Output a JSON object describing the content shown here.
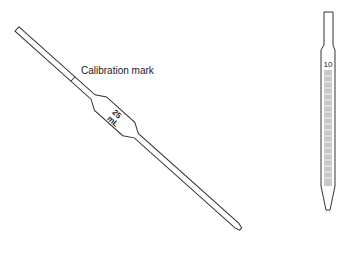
{
  "diagram": {
    "volumetric_pipette": {
      "annotation": "Calibration mark",
      "volume_number": "25",
      "volume_unit": "mL"
    },
    "graduated_pipette": {
      "top_graduation": "10",
      "graduation_count": 20
    },
    "colors": {
      "stroke": "#333333",
      "graduation_fill": "#c8c8c8",
      "background": "#ffffff"
    }
  }
}
